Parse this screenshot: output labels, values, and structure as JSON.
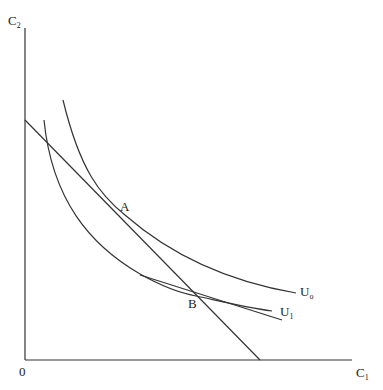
{
  "diagram": {
    "type": "indifference-curve diagram",
    "axes": {
      "y_label": "C",
      "y_label_sub": "2",
      "x_label": "C",
      "x_label_sub": "1",
      "origin_label": "0"
    },
    "curves": [
      {
        "name": "U",
        "sub": "o",
        "description": "higher indifference curve tangent to budget line at A"
      },
      {
        "name": "U",
        "sub": "1",
        "description": "lower indifference curve tangent to steeper line at B"
      }
    ],
    "points": [
      {
        "label": "A"
      },
      {
        "label": "B"
      }
    ],
    "lines": [
      {
        "name": "budget-line",
        "description": "downward sloping line from C2 axis to C1 axis"
      },
      {
        "name": "tangent-line-at-B",
        "description": "flatter line tangent to U1 at B"
      }
    ]
  }
}
